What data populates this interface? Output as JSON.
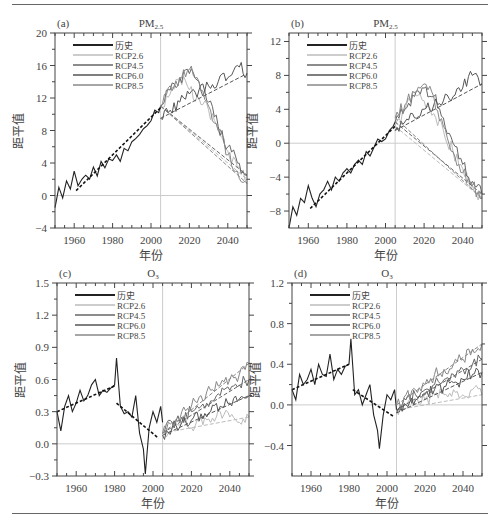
{
  "chart_data": [
    {
      "id": "a",
      "panel_label": "(a)",
      "title": "PM2.5",
      "type": "line",
      "xlabel": "年份",
      "ylabel": "距平值",
      "xlim": [
        1950,
        2050
      ],
      "ylim": [
        -4,
        20
      ],
      "xticks": [
        1960,
        1980,
        2000,
        2020,
        2040
      ],
      "yticks": [
        -4,
        0,
        4,
        8,
        12,
        16,
        20
      ],
      "vline_x": 2005,
      "hline_y": 0,
      "legend": [
        "历史",
        "RCP2.6",
        "RCP4.5",
        "RCP6.0",
        "RCP8.5"
      ],
      "series": [
        {
          "name": "历史",
          "x": [
            1950,
            1952,
            1954,
            1956,
            1958,
            1960,
            1962,
            1964,
            1966,
            1968,
            1970,
            1972,
            1974,
            1976,
            1978,
            1980,
            1982,
            1984,
            1986,
            1988,
            1990,
            1992,
            1994,
            1996,
            1998,
            2000,
            2002,
            2004,
            2005
          ],
          "values": [
            -1.5,
            1.0,
            -0.3,
            1.8,
            0.8,
            3.0,
            1.2,
            2.0,
            2.5,
            2.0,
            3.5,
            2.4,
            4.2,
            3.4,
            4.5,
            4.3,
            5.0,
            4.2,
            5.8,
            5.5,
            6.6,
            7.0,
            7.5,
            8.2,
            8.6,
            9.2,
            10.5,
            10.2,
            11.0
          ]
        },
        {
          "name": "历史趋势",
          "x": [
            1961,
            2005
          ],
          "values": [
            0.6,
            10.8
          ]
        },
        {
          "name": "RCP2.6",
          "x": [
            2005,
            2010,
            2015,
            2020,
            2025,
            2030,
            2035,
            2040,
            2045,
            2050
          ],
          "values": [
            11.0,
            12.5,
            14.5,
            13.0,
            12.0,
            10.5,
            8.0,
            5.5,
            3.5,
            2.0
          ]
        },
        {
          "name": "RCP4.5",
          "x": [
            2005,
            2010,
            2015,
            2020,
            2025,
            2030,
            2035,
            2040,
            2045,
            2050
          ],
          "values": [
            11.0,
            13.0,
            14.5,
            15.0,
            14.0,
            11.5,
            8.5,
            6.0,
            4.0,
            2.5
          ]
        },
        {
          "name": "RCP6.0",
          "x": [
            2005,
            2010,
            2015,
            2020,
            2025,
            2030,
            2035,
            2040,
            2045,
            2050
          ],
          "values": [
            9.5,
            10.5,
            11.5,
            12.5,
            13.0,
            13.5,
            14.0,
            14.5,
            16.0,
            15.0
          ]
        },
        {
          "name": "RCP8.5",
          "x": [
            2005,
            2010,
            2015,
            2020,
            2025,
            2030,
            2035,
            2040,
            2045,
            2050
          ],
          "values": [
            11.0,
            13.5,
            14.5,
            15.5,
            14.0,
            11.0,
            8.0,
            5.0,
            3.0,
            1.5
          ]
        }
      ]
    },
    {
      "id": "b",
      "panel_label": "(b)",
      "title": "PM2.5",
      "type": "line",
      "xlabel": "年份",
      "ylabel": "距平值",
      "xlim": [
        1950,
        2050
      ],
      "ylim": [
        -10,
        13
      ],
      "xticks": [
        1960,
        1980,
        2000,
        2020,
        2040
      ],
      "yticks": [
        -8,
        -4,
        0,
        4,
        8,
        12
      ],
      "vline_x": 2005,
      "hline_y": 0,
      "legend": [
        "历史",
        "RCP2.6",
        "RCP4.5",
        "RCP6.0",
        "RCP8.5"
      ],
      "series": [
        {
          "name": "历史",
          "x": [
            1950,
            1952,
            1954,
            1956,
            1958,
            1960,
            1962,
            1964,
            1966,
            1968,
            1970,
            1972,
            1974,
            1976,
            1978,
            1980,
            1982,
            1984,
            1986,
            1988,
            1990,
            1992,
            1994,
            1996,
            1998,
            2000,
            2002,
            2004,
            2005
          ],
          "values": [
            -10.0,
            -7.5,
            -8.5,
            -6.5,
            -7.0,
            -5.0,
            -6.5,
            -7.5,
            -6.0,
            -5.5,
            -4.5,
            -5.5,
            -4.0,
            -4.5,
            -3.5,
            -3.0,
            -3.5,
            -2.5,
            -2.0,
            -2.5,
            -1.0,
            -1.5,
            -0.5,
            0.5,
            0.2,
            0.5,
            1.5,
            2.0,
            2.5
          ]
        },
        {
          "name": "历史趋势",
          "x": [
            1961,
            2005
          ],
          "values": [
            -7.7,
            2.0
          ]
        },
        {
          "name": "RCP2.6",
          "x": [
            2005,
            2010,
            2015,
            2020,
            2025,
            2030,
            2035,
            2040,
            2045,
            2050
          ],
          "values": [
            2.0,
            4.0,
            6.0,
            5.0,
            3.5,
            1.5,
            -1.0,
            -3.0,
            -5.0,
            -6.5
          ]
        },
        {
          "name": "RCP4.5",
          "x": [
            2005,
            2010,
            2015,
            2020,
            2025,
            2030,
            2035,
            2040,
            2045,
            2050
          ],
          "values": [
            2.5,
            4.0,
            5.5,
            6.5,
            5.5,
            3.0,
            0.0,
            -2.5,
            -4.5,
            -6.0
          ]
        },
        {
          "name": "RCP6.0",
          "x": [
            2005,
            2010,
            2015,
            2020,
            2025,
            2030,
            2035,
            2040,
            2045,
            2050
          ],
          "values": [
            1.5,
            2.5,
            3.0,
            4.0,
            4.5,
            5.0,
            5.5,
            6.5,
            8.0,
            7.0
          ]
        },
        {
          "name": "RCP8.5",
          "x": [
            2005,
            2010,
            2015,
            2020,
            2025,
            2030,
            2035,
            2040,
            2045,
            2050
          ],
          "values": [
            3.0,
            4.5,
            6.0,
            7.0,
            5.5,
            2.0,
            -1.0,
            -3.5,
            -5.0,
            -6.5
          ]
        }
      ]
    },
    {
      "id": "c",
      "panel_label": "(c)",
      "title": "O3",
      "type": "line",
      "xlabel": "年份",
      "ylabel": "距平值",
      "xlim": [
        1950,
        2050
      ],
      "ylim": [
        -0.3,
        1.5
      ],
      "xticks": [
        1960,
        1980,
        2000,
        2020,
        2040
      ],
      "yticks": [
        -0.3,
        0.0,
        0.3,
        0.6,
        0.9,
        1.2,
        1.5
      ],
      "vline_x": 2005,
      "hline_y": 0,
      "legend": [
        "历史",
        "RCP2.6",
        "RCP4.5",
        "RCP6.0",
        "RCP8.5"
      ],
      "series": [
        {
          "name": "历史",
          "x": [
            1950,
            1952,
            1954,
            1956,
            1958,
            1960,
            1962,
            1964,
            1966,
            1968,
            1970,
            1972,
            1974,
            1976,
            1978,
            1980,
            1981,
            1983,
            1985,
            1987,
            1989,
            1991,
            1993,
            1995,
            1996,
            1998,
            2000,
            2002,
            2004,
            2005
          ],
          "values": [
            0.3,
            0.12,
            0.35,
            0.45,
            0.3,
            0.38,
            0.5,
            0.4,
            0.45,
            0.55,
            0.6,
            0.45,
            0.5,
            0.48,
            0.52,
            0.55,
            0.8,
            0.35,
            0.28,
            0.3,
            0.25,
            0.45,
            0.1,
            -0.05,
            -0.28,
            0.15,
            0.3,
            0.2,
            0.35,
            0.2
          ]
        },
        {
          "name": "历史趋势1",
          "x": [
            1950,
            1980
          ],
          "values": [
            0.3,
            0.54
          ]
        },
        {
          "name": "历史趋势2",
          "x": [
            1981,
            2003
          ],
          "values": [
            0.38,
            0.05
          ]
        },
        {
          "name": "RCP2.6",
          "x": [
            2005,
            2010,
            2015,
            2020,
            2025,
            2030,
            2035,
            2040,
            2045,
            2050
          ],
          "values": [
            0.1,
            0.15,
            0.2,
            0.15,
            0.25,
            0.2,
            0.3,
            0.25,
            0.2,
            0.25
          ]
        },
        {
          "name": "RCP4.5",
          "x": [
            2005,
            2010,
            2015,
            2020,
            2025,
            2030,
            2035,
            2040,
            2045,
            2050
          ],
          "values": [
            0.1,
            0.2,
            0.25,
            0.3,
            0.35,
            0.4,
            0.45,
            0.5,
            0.55,
            0.6
          ]
        },
        {
          "name": "RCP6.0",
          "x": [
            2005,
            2010,
            2015,
            2020,
            2025,
            2030,
            2035,
            2040,
            2045,
            2050
          ],
          "values": [
            0.08,
            0.15,
            0.2,
            0.22,
            0.28,
            0.3,
            0.35,
            0.38,
            0.42,
            0.45
          ]
        },
        {
          "name": "RCP8.5",
          "x": [
            2005,
            2010,
            2015,
            2020,
            2025,
            2030,
            2035,
            2040,
            2045,
            2050
          ],
          "values": [
            0.1,
            0.2,
            0.3,
            0.35,
            0.45,
            0.5,
            0.55,
            0.6,
            0.65,
            0.75
          ]
        }
      ]
    },
    {
      "id": "d",
      "panel_label": "(d)",
      "title": "O3",
      "type": "line",
      "xlabel": "年份",
      "ylabel": "距平值",
      "xlim": [
        1950,
        2050
      ],
      "ylim": [
        -0.7,
        1.2
      ],
      "xticks": [
        1960,
        1980,
        2000,
        2020,
        2040
      ],
      "yticks": [
        -0.4,
        0.0,
        0.4,
        0.8,
        1.2
      ],
      "vline_x": 2005,
      "hline_y": 0,
      "legend": [
        "历史",
        "RCP2.6",
        "RCP4.5",
        "RCP6.0",
        "RCP8.5"
      ],
      "series": [
        {
          "name": "历史",
          "x": [
            1950,
            1952,
            1954,
            1956,
            1958,
            1960,
            1962,
            1964,
            1966,
            1968,
            1970,
            1972,
            1974,
            1976,
            1978,
            1980,
            1981,
            1983,
            1985,
            1987,
            1989,
            1991,
            1993,
            1995,
            1996,
            1998,
            2000,
            2002,
            2004,
            2005
          ],
          "values": [
            0.15,
            0.05,
            0.3,
            0.2,
            0.25,
            0.35,
            0.2,
            0.4,
            0.3,
            0.28,
            0.5,
            0.25,
            0.35,
            0.3,
            0.38,
            0.4,
            0.65,
            0.1,
            0.15,
            0.0,
            0.1,
            0.2,
            -0.1,
            -0.25,
            -0.43,
            -0.1,
            0.1,
            0.05,
            0.15,
            -0.05
          ]
        },
        {
          "name": "历史趋势1",
          "x": [
            1950,
            1980
          ],
          "values": [
            0.15,
            0.4
          ]
        },
        {
          "name": "历史趋势2",
          "x": [
            1982,
            2004
          ],
          "values": [
            0.15,
            -0.12
          ]
        },
        {
          "name": "RCP2.6",
          "x": [
            2005,
            2010,
            2015,
            2020,
            2025,
            2030,
            2035,
            2040,
            2045,
            2050
          ],
          "values": [
            -0.05,
            0.0,
            0.05,
            0.05,
            0.1,
            0.1,
            0.15,
            0.1,
            0.15,
            0.1
          ]
        },
        {
          "name": "RCP4.5",
          "x": [
            2005,
            2010,
            2015,
            2020,
            2025,
            2030,
            2035,
            2040,
            2045,
            2050
          ],
          "values": [
            -0.05,
            0.05,
            0.1,
            0.15,
            0.2,
            0.25,
            0.3,
            0.35,
            0.4,
            0.45
          ]
        },
        {
          "name": "RCP6.0",
          "x": [
            2005,
            2010,
            2015,
            2020,
            2025,
            2030,
            2035,
            2040,
            2045,
            2050
          ],
          "values": [
            -0.08,
            0.0,
            0.05,
            0.1,
            0.15,
            0.18,
            0.22,
            0.25,
            0.3,
            0.32
          ]
        },
        {
          "name": "RCP8.5",
          "x": [
            2005,
            2010,
            2015,
            2020,
            2025,
            2030,
            2035,
            2040,
            2045,
            2050
          ],
          "values": [
            0.0,
            0.1,
            0.15,
            0.2,
            0.3,
            0.35,
            0.4,
            0.45,
            0.55,
            0.6
          ]
        }
      ]
    }
  ],
  "colors": {
    "历史": "#222222",
    "RCP2.6": "#bbbbbb",
    "RCP4.5": "#666666",
    "RCP6.0": "#555555",
    "RCP8.5": "#888888",
    "trend": "#111111",
    "ref": "#cccccc",
    "axis": "#444444"
  }
}
